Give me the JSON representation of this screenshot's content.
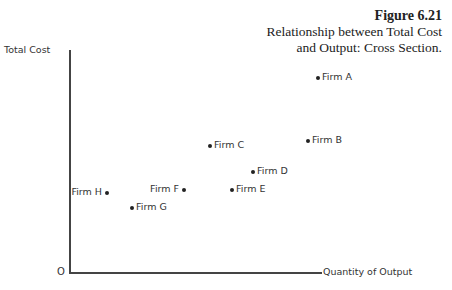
{
  "caption": {
    "figure": "Figure 6.21",
    "line1": "Relationship between Total Cost",
    "line2": "and Output: Cross Section."
  },
  "axes": {
    "ylabel": "Total Cost",
    "xlabel": "Quantity of Output",
    "origin": "O"
  },
  "chart_data": {
    "type": "scatter",
    "title": "Relationship between Total Cost and Output: Cross Section.",
    "figure_number": "Figure 6.21",
    "xlabel": "Quantity of Output",
    "ylabel": "Total Cost",
    "grid": false,
    "ticks": "none",
    "points": [
      {
        "label": "Firm A",
        "x": 248,
        "y": 194,
        "label_side": "right"
      },
      {
        "label": "Firm B",
        "x": 238,
        "y": 131,
        "label_side": "right"
      },
      {
        "label": "Firm C",
        "x": 140,
        "y": 126,
        "label_side": "right"
      },
      {
        "label": "Firm D",
        "x": 183,
        "y": 100,
        "label_side": "right"
      },
      {
        "label": "Firm E",
        "x": 162,
        "y": 82,
        "label_side": "right"
      },
      {
        "label": "Firm F",
        "x": 114,
        "y": 82,
        "label_side": "left"
      },
      {
        "label": "Firm G",
        "x": 62,
        "y": 64,
        "label_side": "right"
      },
      {
        "label": "Firm H",
        "x": 37,
        "y": 79,
        "label_side": "left"
      }
    ]
  }
}
